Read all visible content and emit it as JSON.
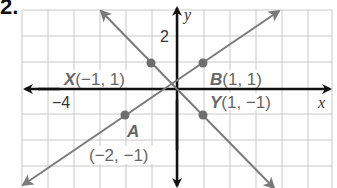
{
  "problem_number": "2.",
  "graph": {
    "x_axis_label": "x",
    "y_axis_label": "y",
    "tick_labels": {
      "x_neg4": "−4",
      "y_2": "2"
    },
    "colors": {
      "grid": "#c8c8c8",
      "axis": "#111111",
      "line": "#7a7a7a",
      "point": "#6e6e6e",
      "label": "#666666"
    },
    "points": [
      {
        "name": "X",
        "coords": "(−1, 1)"
      },
      {
        "name": "B",
        "coords": "(1, 1)"
      },
      {
        "name": "Y",
        "coords": "(1, −1)"
      },
      {
        "name": "A",
        "coords": "(−2, −1)"
      }
    ],
    "lines": [
      {
        "through": [
          "X",
          "Y"
        ],
        "equation": "y = −x"
      },
      {
        "through": [
          "A",
          "B"
        ],
        "equation": "y = (2/3)x + 1/3"
      }
    ]
  }
}
